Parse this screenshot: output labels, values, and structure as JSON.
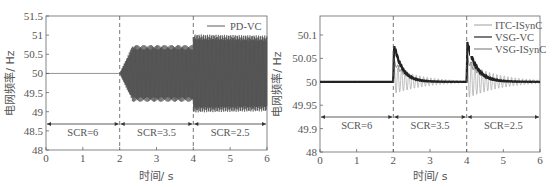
{
  "chart_data": [
    {
      "type": "line",
      "title": "",
      "xlabel": "时间/ s",
      "ylabel": "电网频率/ Hz",
      "xlim": [
        0,
        6
      ],
      "ylim": [
        48,
        51.5
      ],
      "x_ticks": [
        "0",
        "1",
        "2",
        "3",
        "4",
        "5",
        "6"
      ],
      "y_ticks": [
        "48",
        "48.5",
        "49",
        "49.5",
        "50",
        "50.5",
        "51",
        "51.5"
      ],
      "grid": false,
      "legend_position": "upper right",
      "series": [
        {
          "name": "PD-VC",
          "description": "Flat at 50 Hz for 0-2 s; after 2 s oscillation grows to about 49.25-50.75 Hz; after 4 s oscillation about 48.95-51.0 Hz",
          "segments": [
            {
              "t": [
                0,
                2
              ],
              "min": 50.0,
              "max": 50.0
            },
            {
              "t": [
                2,
                4
              ],
              "min": 49.25,
              "max": 50.72
            },
            {
              "t": [
                4,
                6
              ],
              "min": 48.95,
              "max": 51.02
            }
          ]
        }
      ],
      "annotations": [
        {
          "text": "SCR=6",
          "x_range": [
            0,
            2
          ],
          "y": 48.7
        },
        {
          "text": "SCR=3.5",
          "x_range": [
            2,
            4
          ],
          "y": 48.7
        },
        {
          "text": "SCR=2.5",
          "x_range": [
            4,
            6
          ],
          "y": 48.7
        }
      ],
      "vlines": [
        2,
        4
      ]
    },
    {
      "type": "line",
      "title": "",
      "xlabel": "时间/ s",
      "ylabel": "电网频率/ Hz",
      "xlim": [
        0,
        6
      ],
      "ylim": [
        48,
        50.12
      ],
      "x_ticks": [
        "0",
        "1",
        "2",
        "3",
        "4",
        "5",
        "6"
      ],
      "y_ticks": [
        "48",
        "49.9",
        "49.95",
        "50",
        "50.05",
        "50.1"
      ],
      "broken_axis": true,
      "grid": false,
      "legend_position": "upper right",
      "series": [
        {
          "name": "ITC-ISynC",
          "description": "Light gray; damped oscillation after each SCR step, amplitude ~±0.03 Hz decaying",
          "peaks": [
            {
              "t": 2,
              "max": 50.04,
              "min": 49.97
            },
            {
              "t": 4,
              "max": 50.04,
              "min": 49.96
            }
          ]
        },
        {
          "name": "VSG-VC",
          "description": "Black; sharp spike at 2 s to ~50.08 then exponential decay to 50; spike at 4 s to ~50.08 then decay",
          "peaks": [
            {
              "t": 2,
              "max": 50.08
            },
            {
              "t": 4,
              "max": 50.085
            }
          ]
        },
        {
          "name": "VSG-ISynC",
          "description": "Gray; moderate spike and decay similar to VSG-VC with small ripple",
          "peaks": [
            {
              "t": 2,
              "max": 50.05
            },
            {
              "t": 4,
              "max": 50.05
            }
          ]
        }
      ],
      "annotations": [
        {
          "text": "SCR=6",
          "x_range": [
            0,
            2
          ],
          "y": 49.92
        },
        {
          "text": "SCR=3.5",
          "x_range": [
            2,
            4
          ],
          "y": 49.92
        },
        {
          "text": "SCR=2.5",
          "x_range": [
            4,
            6
          ],
          "y": 49.92
        }
      ],
      "vlines": [
        2,
        4
      ]
    }
  ],
  "left": {
    "ylabel": "电网频率/ Hz",
    "xlabel": "时间/ s",
    "legend": [
      "PD-VC"
    ],
    "x_ticks": [
      "0",
      "1",
      "2",
      "3",
      "4",
      "5",
      "6"
    ],
    "y_ticks": [
      "48",
      "48.5",
      "49",
      "49.5",
      "50",
      "50.5",
      "51",
      "51.5"
    ],
    "regions": [
      "SCR=6",
      "SCR=3.5",
      "SCR=2.5"
    ]
  },
  "right": {
    "ylabel": "电网频率/ Hz",
    "xlabel": "时间/ s",
    "legend": [
      "ITC-ISynC",
      "VSG-VC",
      "VSG-ISynC"
    ],
    "x_ticks": [
      "0",
      "1",
      "2",
      "3",
      "4",
      "5",
      "6"
    ],
    "y_ticks": [
      "48",
      "49.9",
      "49.95",
      "50",
      "50.05",
      "50.1"
    ],
    "regions": [
      "SCR=6",
      "SCR=3.5",
      "SCR=2.5"
    ]
  },
  "colors": {
    "axis": "#555555",
    "pdvc": "#4a4a4a",
    "itc": "#b0b0b0",
    "vsgvc": "#222222",
    "vsgisync": "#888888"
  }
}
